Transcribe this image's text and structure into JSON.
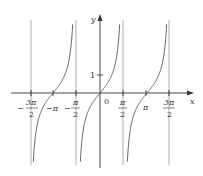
{
  "chart_data": {
    "type": "line",
    "function": "y = tan(x)",
    "title": "",
    "xlabel": "x",
    "ylabel": "y",
    "x_ticks": [
      {
        "value": -4.712,
        "num": "3π",
        "den": "2",
        "sign": "−"
      },
      {
        "value": -3.1416,
        "label": "−π"
      },
      {
        "value": -1.5708,
        "num": "π",
        "den": "2",
        "sign": "−"
      },
      {
        "value": 0,
        "label": "0"
      },
      {
        "value": 1.5708,
        "num": "π",
        "den": "2",
        "sign": ""
      },
      {
        "value": 3.1416,
        "label": "π"
      },
      {
        "value": 4.712,
        "num": "3π",
        "den": "2",
        "sign": ""
      }
    ],
    "y_ticks": [
      {
        "value": 1,
        "label": "1"
      }
    ],
    "vertical_asymptotes": [
      -4.712,
      -1.5708,
      1.5708,
      4.712
    ],
    "zeros": [
      -3.1416,
      0,
      3.1416
    ],
    "xlim": [
      -6.3,
      6.3
    ],
    "ylim": [
      -4,
      4
    ],
    "grid": false,
    "legend": null,
    "colors": {
      "curve": "#555555",
      "asymptote": "#9a9a9a",
      "axis": "#333333"
    }
  },
  "labels": {
    "x_axis": "x",
    "y_axis": "y",
    "origin": "0",
    "y_one": "1",
    "neg_pi": "−π",
    "pi": "π",
    "minus": "−",
    "three_pi": "3π",
    "pi_frac": "π",
    "two": "2"
  }
}
